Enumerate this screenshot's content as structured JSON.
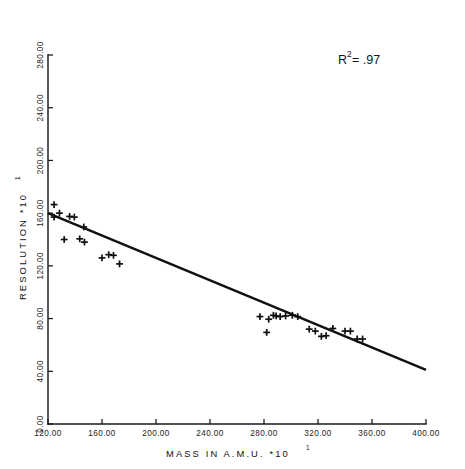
{
  "chart_data": {
    "type": "scatter",
    "title": "",
    "xlabel": "MASS IN A.M.U.  *10",
    "xlabel_exponent": "1",
    "ylabel": "RESOLUTION  *10",
    "ylabel_exponent": "1",
    "xlim": [
      120.0,
      400.0
    ],
    "ylim": [
      0.0,
      280.0
    ],
    "grid": false,
    "legend": null,
    "xticks": [
      "120.00",
      "160.00",
      "200.00",
      "240.00",
      "280.00",
      "320.00",
      "360.00",
      "400.00"
    ],
    "xtick_values": [
      120,
      160,
      200,
      240,
      280,
      320,
      360,
      400
    ],
    "yticks": [
      "0.00",
      "40.00",
      "80.00",
      "120.00",
      "160.00",
      "200.00",
      "240.00",
      "280.00"
    ],
    "ytick_values": [
      0,
      40,
      80,
      120,
      160,
      200,
      240,
      280
    ],
    "annotations": [
      {
        "name": "r-squared",
        "text_main": "R",
        "text_sup": "2",
        "text_tail": " = .97",
        "x": 338,
        "y": 62
      }
    ],
    "series": [
      {
        "name": "observations",
        "marker": "plus",
        "points": [
          {
            "x": 124.5,
            "y": 166.5
          },
          {
            "x": 128.5,
            "y": 160.0
          },
          {
            "x": 124.5,
            "y": 157.0
          },
          {
            "x": 136.0,
            "y": 157.5
          },
          {
            "x": 139.5,
            "y": 157.0
          },
          {
            "x": 146.5,
            "y": 149.5
          },
          {
            "x": 132.0,
            "y": 140.0
          },
          {
            "x": 143.5,
            "y": 140.5
          },
          {
            "x": 147.0,
            "y": 138.0
          },
          {
            "x": 160.0,
            "y": 126.0
          },
          {
            "x": 165.0,
            "y": 128.5
          },
          {
            "x": 168.5,
            "y": 128.0
          },
          {
            "x": 173.0,
            "y": 121.5
          },
          {
            "x": 277.0,
            "y": 81.5
          },
          {
            "x": 283.5,
            "y": 79.5
          },
          {
            "x": 287.0,
            "y": 82.5
          },
          {
            "x": 289.0,
            "y": 82.0
          },
          {
            "x": 292.0,
            "y": 81.5
          },
          {
            "x": 296.0,
            "y": 82.0
          },
          {
            "x": 301.0,
            "y": 82.5
          },
          {
            "x": 305.0,
            "y": 81.5
          },
          {
            "x": 282.0,
            "y": 69.5
          },
          {
            "x": 313.5,
            "y": 72.0
          },
          {
            "x": 318.0,
            "y": 70.5
          },
          {
            "x": 322.5,
            "y": 66.5
          },
          {
            "x": 326.0,
            "y": 67.0
          },
          {
            "x": 331.0,
            "y": 72.5
          },
          {
            "x": 340.0,
            "y": 70.5
          },
          {
            "x": 344.0,
            "y": 70.5
          },
          {
            "x": 349.0,
            "y": 64.5
          },
          {
            "x": 353.0,
            "y": 64.5
          }
        ]
      }
    ],
    "fit_line": {
      "name": "regression-line",
      "x_start": 120.0,
      "y_start": 160.0,
      "x_end": 400.0,
      "y_end": 41.0
    }
  }
}
